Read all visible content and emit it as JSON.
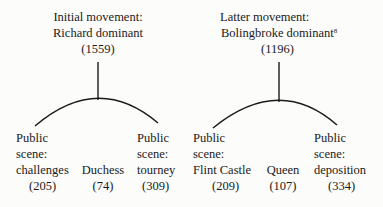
{
  "trees": [
    {
      "root": {
        "line1": "Initial movement:",
        "line2": "Richard dominant",
        "count": "(1559)"
      },
      "children": [
        {
          "line1": "Public",
          "line2": "scene:",
          "line3": "challenges",
          "count": "(205)"
        },
        {
          "line1": "Duchess",
          "count": "(74)"
        },
        {
          "line1": "Public",
          "line2": "scene:",
          "line3": "tourney",
          "count": "(309)"
        }
      ]
    },
    {
      "root": {
        "line1": "Latter movement:",
        "line2": "Bolingbroke dominant",
        "footnote": "8",
        "count": "(1196)"
      },
      "children": [
        {
          "line1": "Public",
          "line2": "scene:",
          "line3": "Flint Castle",
          "count": "(209)"
        },
        {
          "line1": "Queen",
          "count": "(107)"
        },
        {
          "line1": "Public",
          "line2": "scene:",
          "line3": "deposition",
          "count": "(334)"
        }
      ]
    }
  ]
}
